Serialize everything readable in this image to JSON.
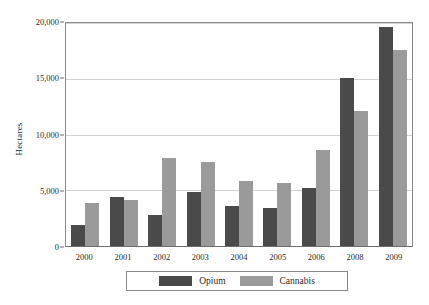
{
  "chart_data": {
    "type": "bar",
    "title": "",
    "xlabel": "",
    "ylabel": "Hectares",
    "categories": [
      "2000",
      "2001",
      "2002",
      "2003",
      "2004",
      "2005",
      "2006",
      "2008",
      "2009"
    ],
    "series": [
      {
        "name": "Opium",
        "color": "#4a4a4a",
        "values": [
          1900,
          4400,
          2750,
          4850,
          3550,
          3400,
          5200,
          15050,
          19600
        ]
      },
      {
        "name": "Cannabis",
        "color": "#9a9a9a",
        "values": [
          3900,
          4150,
          7900,
          7550,
          5850,
          5650,
          8650,
          12150,
          17600
        ]
      }
    ],
    "ylim": [
      0,
      20000
    ],
    "yticks": [
      0,
      5000,
      10000,
      15000,
      20000
    ],
    "ytick_labels": [
      "0",
      "5,000",
      "10,000",
      "15,000",
      "20,000"
    ],
    "grid": true,
    "legend_position": "bottom"
  },
  "legend": {
    "entries": [
      {
        "label": "Opium"
      },
      {
        "label": "Cannabis"
      }
    ]
  },
  "caption": {
    "text": ""
  }
}
